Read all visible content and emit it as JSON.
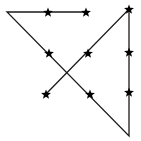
{
  "canvas": {
    "width": 141,
    "height": 141,
    "background": "#ffffff"
  },
  "style": {
    "line_color": "#1a1a1a",
    "line_width": 1.3,
    "star_color": "#000000",
    "star_radius": 5.2
  },
  "path": {
    "points": [
      [
        87,
        12
      ],
      [
        7,
        12
      ],
      [
        129,
        136
      ],
      [
        129,
        9
      ],
      [
        46,
        94
      ]
    ]
  },
  "stars": [
    {
      "x": 48,
      "y": 12
    },
    {
      "x": 86,
      "y": 12
    },
    {
      "x": 129,
      "y": 9
    },
    {
      "x": 49,
      "y": 53
    },
    {
      "x": 88,
      "y": 53
    },
    {
      "x": 129,
      "y": 52
    },
    {
      "x": 46,
      "y": 94
    },
    {
      "x": 90,
      "y": 94
    },
    {
      "x": 129,
      "y": 92
    }
  ]
}
